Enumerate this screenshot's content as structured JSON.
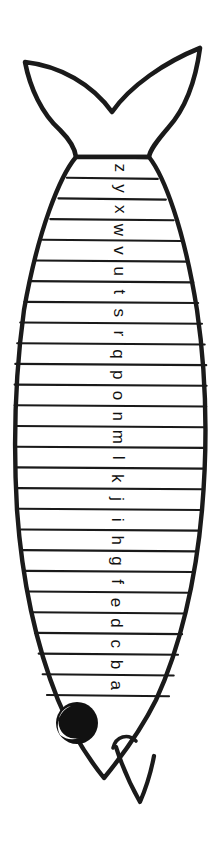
{
  "page": {
    "background_color": "#ffffff",
    "ink_color": "#1a1a1a",
    "width": 222,
    "height": 854,
    "orientation": "vertical-rotated"
  },
  "fish": {
    "parts": [
      {
        "name": "tail-fin",
        "label": "tail fin"
      },
      {
        "name": "body",
        "label": "body"
      },
      {
        "name": "head",
        "label": "head"
      },
      {
        "name": "eye",
        "label": "eye"
      },
      {
        "name": "mouth",
        "label": "mouth"
      },
      {
        "name": "lower-fin",
        "label": "lower fin"
      },
      {
        "name": "snout-fin",
        "label": "snout fin"
      }
    ],
    "eye": {
      "pupil_color": "#111111",
      "highlight_color": "#ffffff"
    }
  },
  "stripes": {
    "count": 26,
    "order": "top-to-bottom",
    "letter_rotation_deg": 90,
    "letters": [
      "z",
      "y",
      "x",
      "w",
      "v",
      "u",
      "t",
      "s",
      "r",
      "q",
      "p",
      "o",
      "n",
      "m",
      "l",
      "k",
      "j",
      "i",
      "h",
      "g",
      "f",
      "e",
      "d",
      "c",
      "b",
      "a"
    ]
  }
}
